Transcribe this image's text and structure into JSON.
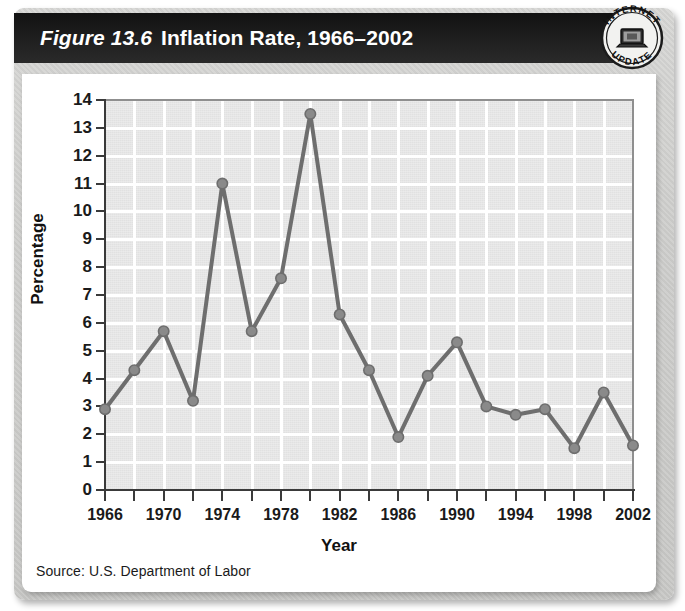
{
  "figure": {
    "number_label": "Figure 13.6",
    "title": "Inflation Rate, 1966–2002",
    "source": "Source: U.S. Department of Labor"
  },
  "badge": {
    "top_text": "INTERNET",
    "bottom_text": "UPDATE",
    "icon": "computer-icon"
  },
  "colors": {
    "title_bar": "#1a1a1a",
    "title_text": "#ffffff",
    "panel": "#d2d2d0",
    "card": "#ffffff",
    "plot_background": "#e1e1e1",
    "gridline": "#ffffff",
    "axis": "#3a3a3a",
    "series_line": "#6e6e6e",
    "series_marker": "#8a8a8a"
  },
  "chart_data": {
    "type": "line",
    "title": "Inflation Rate, 1966–2002",
    "xlabel": "Year",
    "ylabel": "Percentage",
    "xlim": [
      1966,
      2002
    ],
    "ylim": [
      0,
      14
    ],
    "ytick_labels": [
      "0",
      "1",
      "2",
      "3",
      "4",
      "5",
      "6",
      "7",
      "8",
      "9",
      "10",
      "11",
      "12",
      "13",
      "14"
    ],
    "ytick_values": [
      0,
      1,
      2,
      3,
      4,
      5,
      6,
      7,
      8,
      9,
      10,
      11,
      12,
      13,
      14
    ],
    "xtick_values": [
      1966,
      1968,
      1970,
      1972,
      1974,
      1976,
      1978,
      1980,
      1982,
      1984,
      1986,
      1988,
      1990,
      1992,
      1994,
      1996,
      1998,
      2000,
      2002
    ],
    "xtick_labels": [
      "1966",
      "",
      "1970",
      "",
      "1974",
      "",
      "1978",
      "",
      "1982",
      "",
      "1986",
      "",
      "1990",
      "",
      "1994",
      "",
      "1998",
      "",
      "2002"
    ],
    "grid": true,
    "legend": false,
    "x": [
      1966,
      1968,
      1970,
      1972,
      1974,
      1976,
      1978,
      1980,
      1982,
      1984,
      1986,
      1988,
      1990,
      1992,
      1994,
      1996,
      1998,
      2000,
      2002
    ],
    "values": [
      2.9,
      4.3,
      5.7,
      3.2,
      11.0,
      5.7,
      7.6,
      13.5,
      6.3,
      4.3,
      1.9,
      4.1,
      5.3,
      3.0,
      2.7,
      2.9,
      1.5,
      3.5,
      1.6
    ],
    "series": [
      {
        "name": "Inflation Rate",
        "values": [
          2.9,
          4.3,
          5.7,
          3.2,
          11.0,
          5.7,
          7.6,
          13.5,
          6.3,
          4.3,
          1.9,
          4.1,
          5.3,
          3.0,
          2.7,
          2.9,
          1.5,
          3.5,
          1.6
        ]
      }
    ]
  }
}
